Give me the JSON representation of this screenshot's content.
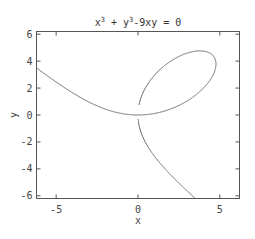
{
  "chart_data": {
    "type": "line",
    "title_parts": {
      "x_base": "x",
      "x_sup": "3",
      "plus": " + ",
      "y_base": "y",
      "y_sup": "3",
      "rest": "-9xy = 0"
    },
    "xlabel": "x",
    "ylabel": "y",
    "xlim": [
      -6.2,
      6.2
    ],
    "ylim": [
      -6.2,
      6.2
    ],
    "xticks": [
      -5,
      0,
      5
    ],
    "xtick_labels": [
      "-5",
      "0",
      "5"
    ],
    "yticks": [
      -6,
      -4,
      -2,
      0,
      2,
      4,
      6
    ],
    "ytick_labels": [
      "-6",
      "-4",
      "-2",
      "0",
      "2",
      "4",
      "6"
    ],
    "grid": false,
    "legend": "none",
    "series": [
      {
        "name": "implicit curve x^3 + y^3 - 9xy = 0 (folium of Descartes)",
        "equation": "x^3 + y^3 - 9xy = 0",
        "color": "#666666",
        "sample_points": [
          [
            -6.2,
            3.55
          ],
          [
            -5,
            2.77
          ],
          [
            -4,
            2.12
          ],
          [
            -3,
            1.53
          ],
          [
            -2,
            0.98
          ],
          [
            -1,
            0.48
          ],
          [
            0,
            0
          ],
          [
            1.17,
            -0.05
          ],
          [
            2.25,
            0.3
          ],
          [
            3.5,
            1.53
          ],
          [
            4.5,
            2.9
          ],
          [
            4.76,
            3.78
          ],
          [
            4.2,
            4.6
          ],
          [
            3.78,
            4.76
          ],
          [
            2.9,
            4.5
          ],
          [
            1.53,
            3.5
          ],
          [
            0.3,
            2.25
          ],
          [
            -0.05,
            1.17
          ],
          [
            0,
            0
          ],
          [
            0.48,
            -1
          ],
          [
            0.98,
            -2
          ],
          [
            1.53,
            -3
          ],
          [
            2.12,
            -4
          ],
          [
            2.77,
            -5
          ],
          [
            3.55,
            -6.2
          ]
        ]
      }
    ]
  }
}
